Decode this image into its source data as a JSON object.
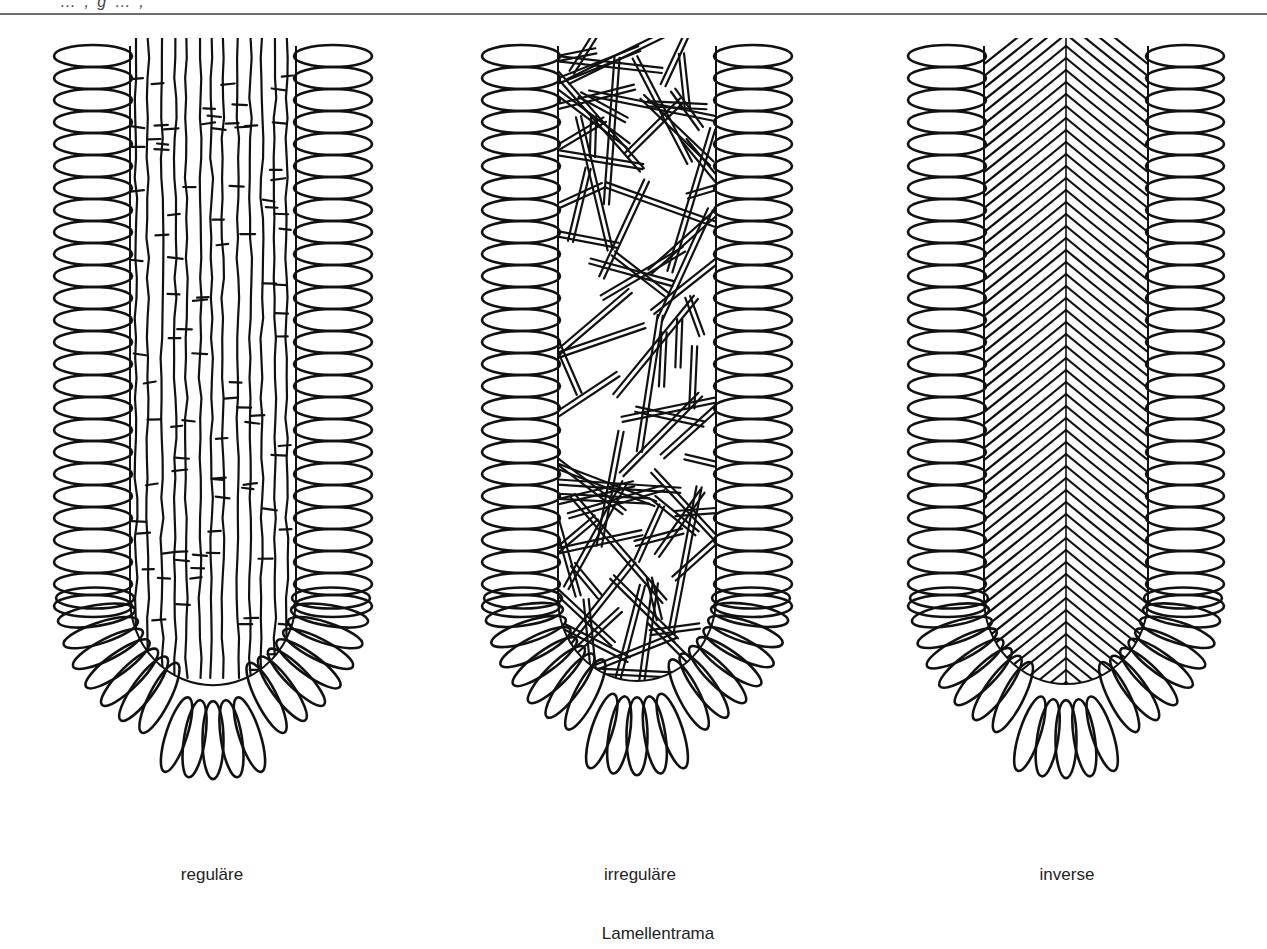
{
  "header": {
    "top_fragment": "… , g …          ,"
  },
  "figure": {
    "title": "Lamellentrama",
    "panels": [
      {
        "id": "regular",
        "caption": "reguläre",
        "x": 48,
        "width": 330,
        "pattern": "parallel"
      },
      {
        "id": "irregular",
        "caption": "irreguläre",
        "x": 476,
        "width": 322,
        "pattern": "interwoven"
      },
      {
        "id": "inverse",
        "caption": "inverse",
        "x": 902,
        "width": 328,
        "pattern": "divergent"
      }
    ],
    "caption_centers": [
      212,
      640,
      1067
    ]
  },
  "colors": {
    "ink": "#111111",
    "rule": "#6e6e6e",
    "paper": "#ffffff"
  }
}
